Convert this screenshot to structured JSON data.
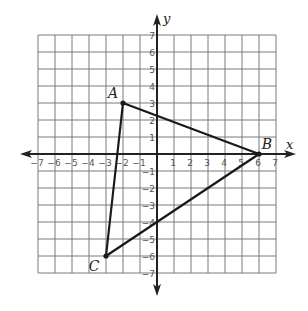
{
  "diagram": {
    "type": "coordinate-plane-triangle",
    "axes": {
      "x_label": "x",
      "y_label": "y",
      "x_range": [
        -7,
        7
      ],
      "y_range": [
        -7,
        7
      ],
      "x_ticks": [
        "-7",
        "-6",
        "-5",
        "-4",
        "-3",
        "-2",
        "-1",
        "1",
        "2",
        "3",
        "4",
        "5",
        "6",
        "7"
      ],
      "y_ticks": [
        "7",
        "6",
        "5",
        "4",
        "3",
        "2",
        "1",
        "-1",
        "-2",
        "-3",
        "-4",
        "-5",
        "-6",
        "-7"
      ]
    },
    "grid": {
      "on": true,
      "step": 1,
      "color": "#7a7a7a"
    },
    "points": [
      {
        "label": "A",
        "x": -2,
        "y": 3
      },
      {
        "label": "B",
        "x": 6,
        "y": 0
      },
      {
        "label": "C",
        "x": -3,
        "y": -6
      }
    ],
    "segments": [
      {
        "from": "A",
        "to": "B"
      },
      {
        "from": "B",
        "to": "C"
      },
      {
        "from": "C",
        "to": "A"
      }
    ],
    "colors": {
      "line": "#1a1a1a",
      "axis": "#222222",
      "grid": "#7a7a7a"
    }
  }
}
